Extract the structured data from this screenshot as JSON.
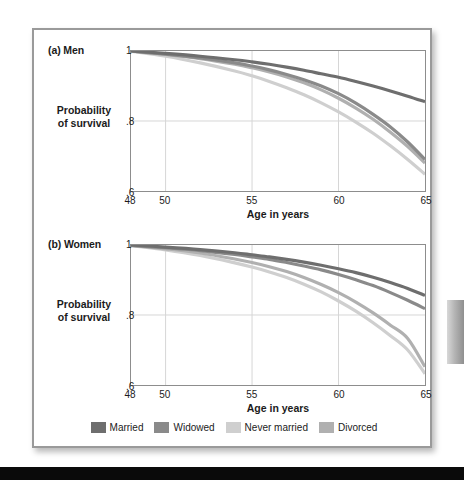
{
  "figure": {
    "xaxis_title": "Age in years",
    "ylabel_line1": "Probability",
    "ylabel_line2": "of survival"
  },
  "legend": {
    "items": [
      {
        "label": "Married",
        "color": "#6e6e6e"
      },
      {
        "label": "Widowed",
        "color": "#8a8a8a"
      },
      {
        "label": "Never married",
        "color": "#cfcfcf"
      },
      {
        "label": "Divorced",
        "color": "#b0b0b0"
      }
    ]
  },
  "panels": {
    "men": {
      "label": "(a) Men"
    },
    "women": {
      "label": "(b) Women"
    }
  },
  "axes": {
    "yticks": [
      "1",
      ".8",
      ".6"
    ],
    "ytick_values": [
      1,
      0.8,
      0.6
    ],
    "xticks": [
      "48",
      "50",
      "55",
      "60",
      "65"
    ],
    "xtick_values": [
      48,
      50,
      55,
      60,
      65
    ]
  },
  "chart_data": {
    "type": "line",
    "xlabel": "Age in years",
    "ylabel": "Probability of survival",
    "xlim": [
      48,
      65
    ],
    "ylim": [
      0.6,
      1.0
    ],
    "xticks": [
      48,
      50,
      55,
      60,
      65
    ],
    "yticks": [
      0.6,
      0.8,
      1.0
    ],
    "grid": "both",
    "legend_position": "bottom-center",
    "panels": [
      {
        "id": "men",
        "label": "(a) Men",
        "x": [
          48,
          50,
          52,
          54,
          55,
          56,
          57,
          58,
          59,
          60,
          61,
          62,
          63,
          64,
          65
        ],
        "series": [
          {
            "name": "Married",
            "color": "#6e6e6e",
            "values": [
              1.0,
              0.993,
              0.985,
              0.975,
              0.969,
              0.962,
              0.954,
              0.945,
              0.935,
              0.925,
              0.913,
              0.9,
              0.886,
              0.871,
              0.855
            ]
          },
          {
            "name": "Widowed",
            "color": "#8a8a8a",
            "values": [
              1.0,
              0.991,
              0.98,
              0.966,
              0.957,
              0.946,
              0.933,
              0.918,
              0.9,
              0.878,
              0.851,
              0.819,
              0.783,
              0.74,
              0.69
            ]
          },
          {
            "name": "Never married",
            "color": "#cfcfcf",
            "values": [
              0.999,
              0.985,
              0.966,
              0.943,
              0.929,
              0.913,
              0.895,
              0.875,
              0.852,
              0.826,
              0.797,
              0.765,
              0.729,
              0.69,
              0.648
            ]
          },
          {
            "name": "Divorced",
            "color": "#b0b0b0",
            "values": [
              1.0,
              0.99,
              0.978,
              0.962,
              0.952,
              0.94,
              0.926,
              0.909,
              0.889,
              0.865,
              0.837,
              0.805,
              0.768,
              0.727,
              0.68
            ]
          }
        ]
      },
      {
        "id": "women",
        "label": "(b) Women",
        "x": [
          48,
          50,
          52,
          54,
          55,
          56,
          57,
          58,
          59,
          60,
          61,
          62,
          63,
          64,
          65
        ],
        "series": [
          {
            "name": "Married",
            "color": "#6e6e6e",
            "values": [
              1.0,
              0.994,
              0.987,
              0.978,
              0.972,
              0.966,
              0.959,
              0.951,
              0.942,
              0.932,
              0.921,
              0.908,
              0.893,
              0.876,
              0.856
            ]
          },
          {
            "name": "Widowed",
            "color": "#8a8a8a",
            "values": [
              0.999,
              0.992,
              0.984,
              0.973,
              0.966,
              0.959,
              0.95,
              0.94,
              0.929,
              0.916,
              0.901,
              0.884,
              0.864,
              0.842,
              0.818
            ]
          },
          {
            "name": "Never married",
            "color": "#cfcfcf",
            "values": [
              0.998,
              0.986,
              0.97,
              0.949,
              0.937,
              0.923,
              0.907,
              0.888,
              0.866,
              0.84,
              0.811,
              0.778,
              0.741,
              0.7,
              0.632
            ]
          },
          {
            "name": "Divorced",
            "color": "#b0b0b0",
            "values": [
              0.999,
              0.989,
              0.977,
              0.96,
              0.95,
              0.938,
              0.924,
              0.907,
              0.887,
              0.864,
              0.837,
              0.806,
              0.771,
              0.733,
              0.652
            ]
          }
        ]
      }
    ]
  }
}
